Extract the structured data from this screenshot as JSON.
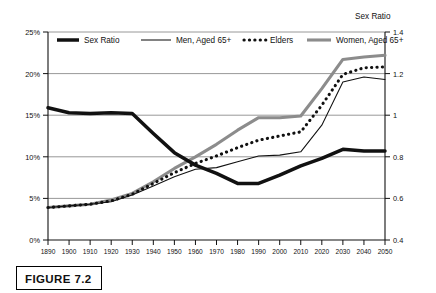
{
  "figure": {
    "caption": "FIGURE 7.2"
  },
  "chart_data": {
    "type": "line",
    "title": "",
    "xlabel": "",
    "ylabel": "",
    "y2label": "Sex Ratio",
    "grid": true,
    "legend_position": "top-inside",
    "x": [
      1890,
      1900,
      1910,
      1920,
      1930,
      1940,
      1950,
      1960,
      1970,
      1980,
      1990,
      2000,
      2010,
      2020,
      2030,
      2040,
      2050
    ],
    "categories": [
      "1890",
      "1900",
      "1910",
      "1920",
      "1930",
      "1940",
      "1950",
      "1960",
      "1970",
      "1980",
      "1990",
      "2000",
      "2010",
      "2020",
      "2030",
      "2040",
      "2050"
    ],
    "xlim": [
      1890,
      2050
    ],
    "ylim": [
      0,
      25
    ],
    "yticks": [
      0,
      5,
      10,
      15,
      20,
      25
    ],
    "ytick_labels": [
      "0%",
      "5%",
      "10%",
      "15%",
      "20%",
      "25%"
    ],
    "y2lim": [
      0.4,
      1.4
    ],
    "y2ticks": [
      0.4,
      0.6,
      0.8,
      1.0,
      1.2,
      1.4
    ],
    "y2tick_labels": [
      "0.4",
      "0.6",
      "0.8",
      "1",
      "1.2",
      "1.4"
    ],
    "series": [
      {
        "name": "Sex Ratio",
        "axis": "right",
        "style": "thick-solid",
        "color": "#111111",
        "values_ratio": [
          0.955,
          0.942,
          0.94,
          0.941,
          0.938,
          0.898,
          0.845,
          0.8,
          0.742,
          0.672,
          0.668,
          0.71,
          0.76,
          0.81,
          0.848,
          0.842,
          0.842
        ],
        "values_percent_plot": [
          15.9,
          15.3,
          15.2,
          15.3,
          15.2,
          12.8,
          10.5,
          9.0,
          8.0,
          6.8,
          6.8,
          7.8,
          8.9,
          9.8,
          10.9,
          10.7,
          10.7
        ]
      },
      {
        "name": "Men, Aged 65+",
        "axis": "left",
        "style": "thin-solid",
        "color": "#111111",
        "values": [
          3.9,
          4.1,
          4.3,
          4.6,
          5.4,
          6.5,
          7.6,
          8.5,
          8.7,
          9.4,
          10.1,
          10.2,
          10.6,
          13.8,
          19.0,
          19.6,
          19.3
        ]
      },
      {
        "name": "Elders",
        "axis": "left",
        "style": "dotted",
        "color": "#111111",
        "values": [
          3.9,
          4.1,
          4.3,
          4.7,
          5.5,
          6.8,
          8.1,
          9.2,
          10.1,
          11.1,
          12.0,
          12.5,
          13.0,
          16.2,
          19.9,
          20.7,
          20.8
        ]
      },
      {
        "name": "Women, Aged 65+",
        "axis": "left",
        "style": "thick-gray",
        "color": "#8c8c8c",
        "values": [
          3.9,
          4.1,
          4.3,
          4.8,
          5.6,
          7.0,
          8.6,
          10.0,
          11.5,
          13.2,
          14.7,
          14.7,
          14.9,
          18.2,
          21.7,
          22.0,
          22.2
        ]
      }
    ],
    "legend": [
      {
        "label": "Sex Ratio",
        "style": "thick-solid",
        "color": "#111111"
      },
      {
        "label": "Men, Aged 65+",
        "style": "thin-solid",
        "color": "#111111"
      },
      {
        "label": "Elders",
        "style": "dotted",
        "color": "#111111"
      },
      {
        "label": "Women, Aged 65+",
        "style": "thick-gray",
        "color": "#8c8c8c"
      }
    ]
  }
}
